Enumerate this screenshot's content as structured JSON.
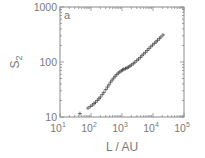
{
  "chart_data": {
    "type": "scatter",
    "title": "",
    "panel_label": "a",
    "xlabel": "L / AU",
    "ylabel": "S",
    "ylabel_subscript": "2",
    "xscale": "log",
    "yscale": "log",
    "xlim": [
      10,
      100000
    ],
    "ylim": [
      10,
      1000
    ],
    "x_ticks": [
      {
        "base": "10",
        "exp": "1",
        "value": 10
      },
      {
        "base": "10",
        "exp": "2",
        "value": 100
      },
      {
        "base": "10",
        "exp": "3",
        "value": 1000
      },
      {
        "base": "10",
        "exp": "4",
        "value": 10000
      },
      {
        "base": "10",
        "exp": "5",
        "value": 100000
      }
    ],
    "y_ticks": [
      {
        "label": "10",
        "value": 10
      },
      {
        "label": "100",
        "value": 100
      },
      {
        "label": "1000",
        "value": 1000
      }
    ],
    "grid": false,
    "marker": "+",
    "series": [
      {
        "name": "S2",
        "x": [
          44,
          80,
          95,
          110,
          125,
          140,
          160,
          180,
          200,
          230,
          260,
          300,
          340,
          380,
          430,
          480,
          540,
          600,
          680,
          760,
          850,
          950,
          1050,
          1150,
          1300,
          1450,
          1600,
          1800,
          2000,
          2300,
          2600,
          3000,
          3400,
          3900,
          4400,
          5000,
          5700,
          6500,
          7400,
          8500,
          9700,
          11000,
          12500,
          14000,
          16000,
          18000,
          21000
        ],
        "y": [
          11.5,
          14.5,
          15.5,
          16.5,
          17.5,
          18.5,
          20,
          21.5,
          23,
          25.5,
          28,
          31.5,
          35,
          38.5,
          43,
          47,
          51,
          55,
          59,
          63,
          66,
          69,
          72,
          74,
          76,
          78,
          81,
          84,
          88,
          93,
          99,
          106,
          113,
          121,
          130,
          140,
          150,
          162,
          175,
          189,
          203,
          218,
          232,
          248,
          265,
          285,
          310
        ]
      }
    ]
  },
  "colors": {
    "axis": "#8a8a8a",
    "text": "#7a7a7a",
    "marker": "#3a3a3a",
    "background": "#ffffff"
  }
}
